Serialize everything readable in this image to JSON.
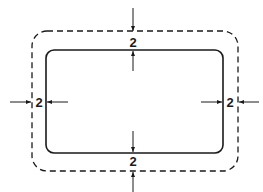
{
  "diagram": {
    "colors": {
      "line": "#1a1a1a",
      "background": "#ffffff"
    },
    "outer_boundary": {
      "style": "dashed",
      "shape": "rounded-rectangle"
    },
    "inner_boundary": {
      "style": "solid",
      "shape": "rounded-rectangle"
    },
    "dimensions": {
      "top": "2",
      "bottom": "2",
      "left": "2",
      "right": "2"
    }
  }
}
